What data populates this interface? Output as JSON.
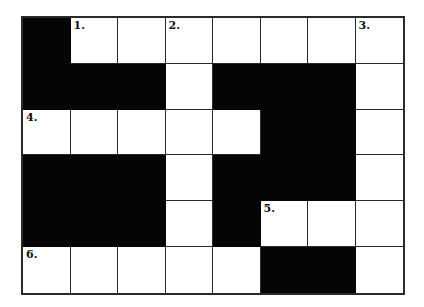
{
  "puzzle": {
    "type": "crossword",
    "cols": 8,
    "rows": 6,
    "colors": {
      "block": "#050505",
      "empty": "#ffffff",
      "line": "#2a2a2a"
    },
    "grid": [
      [
        "B",
        "W",
        "W",
        "W",
        "W",
        "W",
        "W",
        "W"
      ],
      [
        "B",
        "B",
        "B",
        "W",
        "B",
        "B",
        "B",
        "W"
      ],
      [
        "W",
        "W",
        "W",
        "W",
        "W",
        "B",
        "B",
        "W"
      ],
      [
        "B",
        "B",
        "B",
        "W",
        "B",
        "B",
        "B",
        "W"
      ],
      [
        "B",
        "B",
        "B",
        "W",
        "B",
        "W",
        "W",
        "W"
      ],
      [
        "W",
        "W",
        "W",
        "W",
        "W",
        "B",
        "B",
        "W"
      ]
    ],
    "numbers": [
      {
        "row": 0,
        "col": 1,
        "label": "1."
      },
      {
        "row": 0,
        "col": 3,
        "label": "2."
      },
      {
        "row": 0,
        "col": 7,
        "label": "3."
      },
      {
        "row": 2,
        "col": 0,
        "label": "4."
      },
      {
        "row": 4,
        "col": 5,
        "label": "5."
      },
      {
        "row": 5,
        "col": 0,
        "label": "6."
      }
    ]
  }
}
